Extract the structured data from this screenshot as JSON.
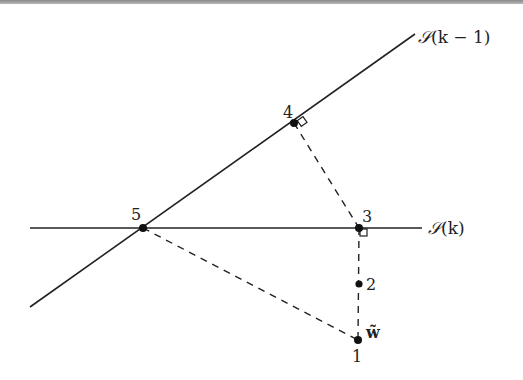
{
  "figure": {
    "title": "",
    "lines": [
      {
        "id": "S_k_minus_1",
        "label": "S(k − 1)",
        "label_prefix": "𝒮",
        "label_args": "(k − 1)"
      },
      {
        "id": "S_k",
        "label": "S(k)",
        "label_prefix": "𝒮",
        "label_args": "(k)"
      }
    ],
    "points": [
      {
        "id": "p1",
        "label": "1",
        "extra_label": "w̃"
      },
      {
        "id": "p2",
        "label": "2"
      },
      {
        "id": "p3",
        "label": "3"
      },
      {
        "id": "p4",
        "label": "4"
      },
      {
        "id": "p5",
        "label": "5"
      }
    ],
    "extra_label_bold": "w̃",
    "colors": {
      "line": "#222222",
      "background": "#ffffff"
    }
  }
}
